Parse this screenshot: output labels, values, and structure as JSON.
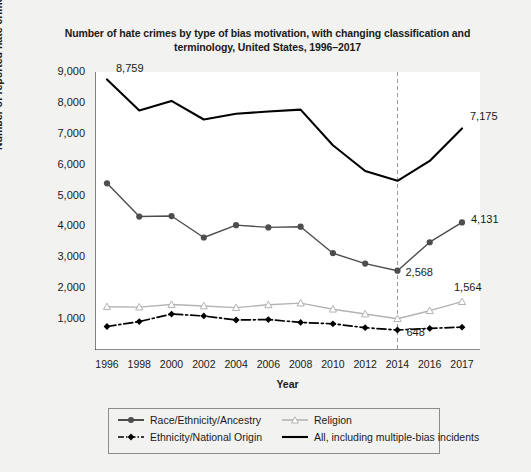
{
  "chart_data": {
    "type": "line",
    "title": "Number of hate crimes by type of bias motivation, with changing classification and terminology, United States, 1996–2017",
    "xlabel": "Year",
    "ylabel": "Number of reported hate crimes",
    "x": [
      1996,
      1998,
      2000,
      2002,
      2004,
      2006,
      2008,
      2010,
      2012,
      2014,
      2016,
      2017
    ],
    "xticklabels": [
      "1996",
      "1998",
      "2000",
      "2002",
      "2004",
      "2006",
      "2008",
      "2010",
      "2012",
      "2014",
      "2016",
      "2017"
    ],
    "yticks": [
      0,
      1000,
      2000,
      3000,
      4000,
      5000,
      6000,
      7000,
      8000,
      9000
    ],
    "yticklabels": [
      "",
      "1,000",
      "2,000",
      "3,000",
      "4,000",
      "5,000",
      "6,000",
      "7,000",
      "8,000",
      "9,000"
    ],
    "ylim": [
      0,
      9000
    ],
    "grid": false,
    "legend_position": "below-axes",
    "annotations": [
      {
        "text": "8,759",
        "x": 1996,
        "y": 8759,
        "series": "All, including multiple-bias incidents"
      },
      {
        "text": "7,175",
        "x": 2017,
        "y": 7175,
        "series": "All, including multiple-bias incidents"
      },
      {
        "text": "4,131",
        "x": 2017,
        "y": 4131,
        "series": "Race/Ethnicity/Ancestry"
      },
      {
        "text": "2,568",
        "x": 2014,
        "y": 2568,
        "series": "Race/Ethnicity/Ancestry"
      },
      {
        "text": "1,564",
        "x": 2017,
        "y": 1564,
        "series": "Religion"
      },
      {
        "text": "648",
        "x": 2014,
        "y": 648,
        "series": "Ethnicity/National Origin"
      }
    ],
    "vertical_reference_line": {
      "x": 2014,
      "style": "dashed",
      "color": "#999999"
    },
    "series": [
      {
        "name": "All, including multiple-bias incidents",
        "color": "#000000",
        "line_style": "solid",
        "marker": "none",
        "values": [
          8759,
          7755,
          8063,
          7462,
          7649,
          7722,
          7783,
          6628,
          5796,
          5479,
          6121,
          7175
        ]
      },
      {
        "name": "Race/Ethnicity/Ancestry",
        "color": "#4d4d4d",
        "line_style": "solid",
        "marker": "circle",
        "values": [
          5396,
          4321,
          4337,
          3642,
          4042,
          3969,
          3992,
          3135,
          2797,
          2568,
          3489,
          4131
        ]
      },
      {
        "name": "Religion",
        "color": "#b3b3b3",
        "line_style": "solid",
        "marker": "triangle",
        "values": [
          1401,
          1390,
          1472,
          1426,
          1374,
          1462,
          1519,
          1322,
          1166,
          1014,
          1273,
          1564
        ]
      },
      {
        "name": "Ethnicity/National Origin",
        "color": "#000000",
        "line_style": "dashdot",
        "marker": "diamond",
        "values": [
          760,
          919,
          1164,
          1102,
          972,
          984,
          894,
          847,
          722,
          648,
          700,
          740
        ]
      }
    ]
  },
  "legend": {
    "entries": [
      {
        "label": "Race/Ethnicity/Ancestry",
        "key": "circle-solid-gray"
      },
      {
        "label": "Religion",
        "key": "triangle-solid-lightgray"
      },
      {
        "label": "Ethnicity/National Origin",
        "key": "diamond-dashdot-black"
      },
      {
        "label": "All, including multiple-bias incidents",
        "key": "line-solid-black"
      }
    ]
  }
}
